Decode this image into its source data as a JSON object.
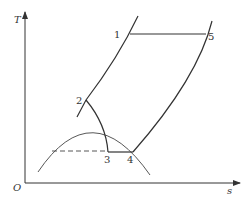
{
  "diagram": {
    "type": "T-s diagram",
    "axes": {
      "y_label": "T",
      "x_label": "s",
      "origin_label": "O"
    },
    "points": [
      {
        "id": "1",
        "label": "1"
      },
      {
        "id": "2",
        "label": "2"
      },
      {
        "id": "3",
        "label": "3"
      },
      {
        "id": "4",
        "label": "4"
      },
      {
        "id": "5",
        "label": "5"
      }
    ],
    "colors": {
      "line": "#333333",
      "background": "#ffffff"
    }
  }
}
